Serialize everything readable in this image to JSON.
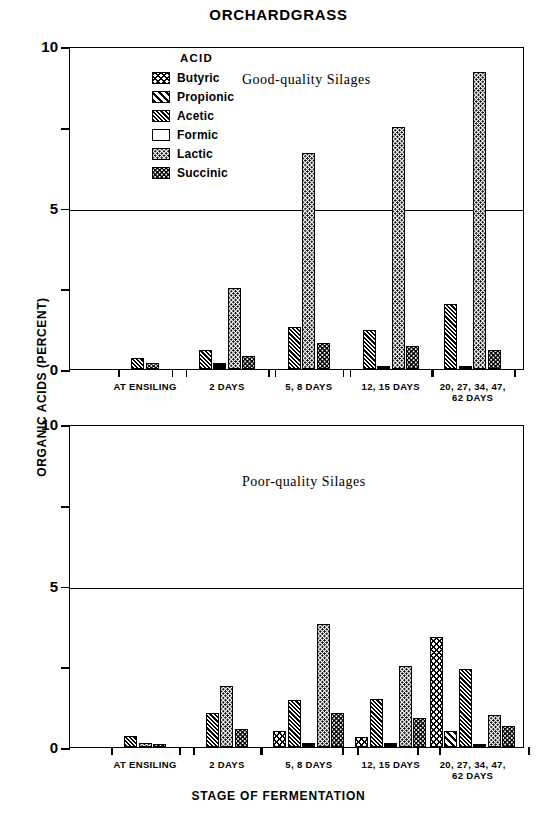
{
  "figure": {
    "title": "ORCHARDGRASS",
    "ylabel": "ORGANIC ACIDS (PERCENT)",
    "xlabel": "STAGE OF FERMENTATION"
  },
  "legend": {
    "title": "ACID",
    "items": [
      {
        "label": "Butyric",
        "pattern": "cross-hatch"
      },
      {
        "label": "Propionic",
        "pattern": "diagonal-stripe"
      },
      {
        "label": "Acetic",
        "pattern": "fine-diagonal"
      },
      {
        "label": "Formic",
        "pattern": "solid-black"
      },
      {
        "label": "Lactic",
        "pattern": "light-dots"
      },
      {
        "label": "Succinic",
        "pattern": "dense-dots"
      }
    ]
  },
  "chart_data": {
    "type": "bar",
    "title": "ORCHARDGRASS",
    "xlabel": "STAGE OF FERMENTATION",
    "ylabel": "ORGANIC ACIDS (PERCENT)",
    "ylim": [
      0,
      10
    ],
    "yticks": [
      0,
      2.5,
      5,
      7.5,
      10
    ],
    "ytick_labels": [
      "0",
      "",
      "5",
      "",
      "10"
    ],
    "grid": "horizontal-line-at-5",
    "legend_position": "upper-left-inside",
    "categories": [
      "AT ENSILING",
      "2 DAYS",
      "5, 8 DAYS",
      "12, 15 DAYS",
      "20, 27, 34, 47,\n62 DAYS"
    ],
    "panels": [
      {
        "caption": "Good-quality Silages",
        "series": [
          {
            "name": "Butyric",
            "values": [
              0,
              0,
              0,
              0,
              0
            ]
          },
          {
            "name": "Propionic",
            "values": [
              0,
              0,
              0,
              0,
              0
            ]
          },
          {
            "name": "Acetic",
            "values": [
              0.35,
              0.6,
              1.3,
              1.2,
              2.0
            ]
          },
          {
            "name": "Formic",
            "values": [
              0,
              0.2,
              0,
              0.1,
              0.1
            ]
          },
          {
            "name": "Lactic",
            "values": [
              0,
              2.5,
              6.7,
              7.5,
              9.2
            ]
          },
          {
            "name": "Succinic",
            "values": [
              0.18,
              0.4,
              0.8,
              0.7,
              0.6
            ]
          }
        ]
      },
      {
        "caption": "Poor-quality Silages",
        "series": [
          {
            "name": "Butyric",
            "values": [
              0,
              0,
              0.5,
              0.3,
              3.4
            ]
          },
          {
            "name": "Propionic",
            "values": [
              0,
              0,
              0,
              0,
              0.5
            ]
          },
          {
            "name": "Acetic",
            "values": [
              0.35,
              1.05,
              1.45,
              1.5,
              2.4
            ]
          },
          {
            "name": "Formic",
            "values": [
              0,
              0,
              0.12,
              0.12,
              0.1
            ]
          },
          {
            "name": "Lactic",
            "values": [
              0.12,
              1.9,
              3.8,
              2.5,
              1.0
            ]
          },
          {
            "name": "Succinic",
            "values": [
              0.1,
              0.55,
              1.05,
              0.9,
              0.65
            ]
          }
        ]
      }
    ]
  }
}
